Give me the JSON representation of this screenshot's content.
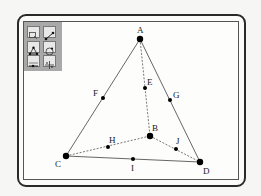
{
  "toolbar": {
    "tools": [
      {
        "name": "select-tool-icon"
      },
      {
        "name": "segment-tool-icon"
      },
      {
        "name": "polygon-tool-icon"
      },
      {
        "name": "circle-tool-icon"
      },
      {
        "name": "text-tool-icon"
      },
      {
        "name": "move-tool-icon"
      }
    ]
  },
  "diagram": {
    "points": [
      {
        "label": "A",
        "x": 140,
        "y": 39,
        "size": "large"
      },
      {
        "label": "B",
        "x": 150,
        "y": 136,
        "size": "large"
      },
      {
        "label": "C",
        "x": 66,
        "y": 156,
        "size": "large"
      },
      {
        "label": "D",
        "x": 200,
        "y": 162,
        "size": "large"
      },
      {
        "label": "E",
        "x": 145,
        "y": 88,
        "size": "small"
      },
      {
        "label": "F",
        "x": 103,
        "y": 98,
        "size": "small"
      },
      {
        "label": "G",
        "x": 170,
        "y": 100,
        "size": "small"
      },
      {
        "label": "H",
        "x": 108,
        "y": 147,
        "size": "small"
      },
      {
        "label": "I",
        "x": 133,
        "y": 159,
        "size": "small"
      },
      {
        "label": "J",
        "x": 176,
        "y": 149,
        "size": "small"
      }
    ],
    "solid_edges": [
      [
        "A",
        "C"
      ],
      [
        "A",
        "D"
      ],
      [
        "C",
        "D"
      ]
    ],
    "dashed_edges": [
      [
        "A",
        "B"
      ],
      [
        "C",
        "B"
      ],
      [
        "B",
        "D"
      ]
    ],
    "labels": {
      "A": "A",
      "B": "B",
      "C": "C",
      "D": "D",
      "E": "E",
      "F": "F",
      "G": "G",
      "H": "H",
      "I": "I",
      "J": "J"
    }
  }
}
